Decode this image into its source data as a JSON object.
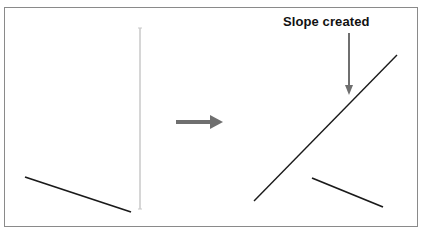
{
  "diagram": {
    "annotation": "Slope created",
    "colors": {
      "line": "#1a1a1a",
      "arrow": "#6f6f6f",
      "guide": "#c8c8c8",
      "frame": "#8a8a8a"
    },
    "left_panel": {
      "segment": {
        "x1": 25,
        "y1": 177,
        "x2": 131,
        "y2": 212
      },
      "vertical_guide": {
        "x": 140,
        "y1": 28,
        "y2": 209
      }
    },
    "transition_arrow": {
      "x1": 176,
      "y1": 122,
      "x2": 222,
      "y2": 122
    },
    "right_panel": {
      "long_segment": {
        "x1": 254,
        "y1": 201,
        "x2": 397,
        "y2": 55
      },
      "short_segment": {
        "x1": 312,
        "y1": 178,
        "x2": 383,
        "y2": 207
      },
      "pointer_arrow": {
        "x": 349,
        "y1": 33,
        "y2": 94
      }
    }
  }
}
